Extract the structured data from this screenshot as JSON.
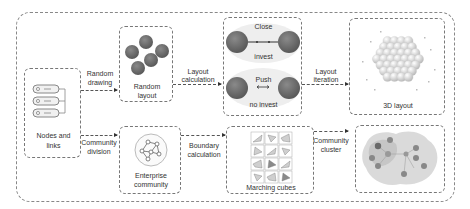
{
  "diagram": {
    "nodes": {
      "nodes_links": {
        "label_line1": "Nodes and",
        "label_line2": "links",
        "icon": "server-stack-icon"
      },
      "random_layout": {
        "label_line1": "Random",
        "label_line2": "layout"
      },
      "force_layout": {
        "close_label": "Close",
        "invest_label": "invest",
        "push_label": "Push",
        "no_invest_label": "no invest"
      },
      "layout_3d": {
        "label": "3D layout"
      },
      "enterprise_community": {
        "label_line1": "Enterprise",
        "label_line2": "community",
        "icon": "network-graph-icon"
      },
      "marching_cubes": {
        "label": "Marching cubes"
      },
      "community_cluster_view": {
        "label": ""
      }
    },
    "edges": {
      "random_drawing": {
        "line1": "Random",
        "line2": "drawing"
      },
      "layout_calculation": {
        "line1": "Layout",
        "line2": "calculation"
      },
      "layout_iteration": {
        "line1": "Layout",
        "line2": "iteration"
      },
      "community_division": {
        "line1": "Community",
        "line2": "division"
      },
      "boundary_calculation": {
        "line1": "Boundary",
        "line2": "calculation"
      },
      "community_cluster": {
        "line1": "Community",
        "line2": "cluster"
      }
    },
    "colors": {
      "sphere": "#6e6e6e",
      "sphere_light": "#d0d0d0",
      "halo": "#ececec",
      "cluster_blob": "#cfcfcf",
      "border": "#777777"
    }
  }
}
